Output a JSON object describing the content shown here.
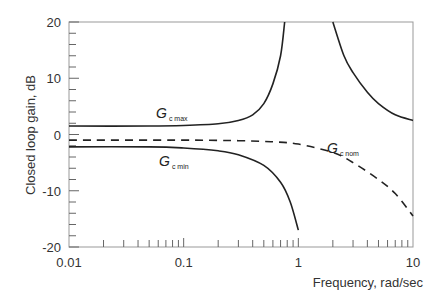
{
  "chart_data": {
    "type": "line",
    "title": "",
    "xlabel": "Frequency, rad/sec",
    "ylabel": "Closed loop gain, dB",
    "xscale": "log",
    "xlim": [
      0.01,
      10
    ],
    "ylim": [
      -20,
      20
    ],
    "x_ticks": [
      "0.01",
      "0.1",
      "1",
      "10"
    ],
    "y_ticks": [
      "20",
      "10",
      "0",
      "-10",
      "-20"
    ],
    "grid": false,
    "legend": "inline labels",
    "series": [
      {
        "name": "Gc max",
        "label_main": "G",
        "label_sub": "c max",
        "style": "solid",
        "points": [
          [
            0.01,
            1.5
          ],
          [
            0.05,
            1.5
          ],
          [
            0.1,
            1.6
          ],
          [
            0.2,
            1.9
          ],
          [
            0.3,
            2.5
          ],
          [
            0.4,
            3.5
          ],
          [
            0.5,
            5.5
          ],
          [
            0.6,
            9
          ],
          [
            0.7,
            14
          ],
          [
            0.76,
            20
          ]
        ],
        "points_branch2": [
          [
            2.0,
            20
          ],
          [
            2.5,
            14
          ],
          [
            3.0,
            11
          ],
          [
            4.0,
            7.5
          ],
          [
            5.0,
            5.5
          ],
          [
            7.0,
            3.5
          ],
          [
            10.0,
            2.5
          ]
        ]
      },
      {
        "name": "Gc nom",
        "label_main": "G",
        "label_sub": "c nom",
        "style": "dashed",
        "points": [
          [
            0.01,
            -1
          ],
          [
            0.1,
            -1
          ],
          [
            0.3,
            -1.1
          ],
          [
            0.6,
            -1.3
          ],
          [
            1.0,
            -1.7
          ],
          [
            2.0,
            -3.2
          ],
          [
            3.0,
            -5
          ],
          [
            5.0,
            -8
          ],
          [
            7.0,
            -10.5
          ],
          [
            10.0,
            -14.5
          ]
        ]
      },
      {
        "name": "Gc min",
        "label_main": "G",
        "label_sub": "c min",
        "style": "solid",
        "points": [
          [
            0.01,
            -2.2
          ],
          [
            0.05,
            -2.2
          ],
          [
            0.1,
            -2.4
          ],
          [
            0.2,
            -2.9
          ],
          [
            0.3,
            -3.6
          ],
          [
            0.5,
            -5.5
          ],
          [
            0.7,
            -8.5
          ],
          [
            0.85,
            -12
          ],
          [
            1.0,
            -17
          ]
        ]
      }
    ]
  }
}
